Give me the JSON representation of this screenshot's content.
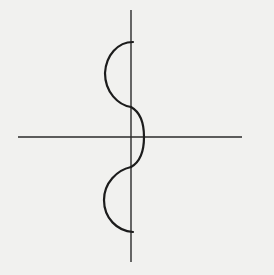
{
  "figure": {
    "colors": {
      "background": "#f1f1ef",
      "axis": "#2a2a2a",
      "curve": "#1c1c1c"
    },
    "axes": {
      "x_axis": {
        "x1": 18,
        "x2": 242,
        "y": 137
      },
      "y_axis": {
        "x": 131,
        "y1": 10,
        "y2": 262
      }
    },
    "curve": {
      "segments": [
        {
          "name": "upper-left-semicircle",
          "from": [
            133,
            42
          ],
          "to": [
            131,
            107
          ],
          "bulge": "left"
        },
        {
          "name": "middle-right-arc",
          "from": [
            131,
            107
          ],
          "to": [
            131,
            167
          ],
          "bulge": "right"
        },
        {
          "name": "lower-left-semicircle",
          "from": [
            131,
            167
          ],
          "to": [
            133,
            232
          ],
          "bulge": "left"
        }
      ]
    }
  }
}
